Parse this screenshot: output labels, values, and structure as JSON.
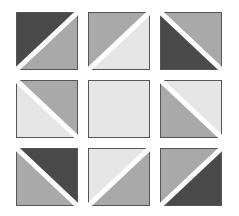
{
  "colors": {
    "dark": "#4a4a4a",
    "medium": "#a9a9a9",
    "light": "#e6e6e6",
    "border": "#555555",
    "gap": "#ffffff"
  },
  "grid": {
    "rows": 3,
    "cols": 3,
    "tiles": [
      {
        "row": 0,
        "col": 0,
        "diagonal": "anti",
        "first": "dark",
        "second": "medium"
      },
      {
        "row": 0,
        "col": 1,
        "diagonal": "anti",
        "first": "medium",
        "second": "light"
      },
      {
        "row": 0,
        "col": 2,
        "diagonal": "main",
        "first": "dark",
        "second": "medium"
      },
      {
        "row": 1,
        "col": 0,
        "diagonal": "main",
        "first": "light",
        "second": "medium"
      },
      {
        "row": 1,
        "col": 1,
        "diagonal": "none",
        "first": "light",
        "second": "light"
      },
      {
        "row": 1,
        "col": 2,
        "diagonal": "main",
        "first": "medium",
        "second": "light"
      },
      {
        "row": 2,
        "col": 0,
        "diagonal": "main",
        "first": "medium",
        "second": "dark"
      },
      {
        "row": 2,
        "col": 1,
        "diagonal": "anti",
        "first": "light",
        "second": "medium"
      },
      {
        "row": 2,
        "col": 2,
        "diagonal": "anti",
        "first": "medium",
        "second": "dark"
      }
    ]
  }
}
